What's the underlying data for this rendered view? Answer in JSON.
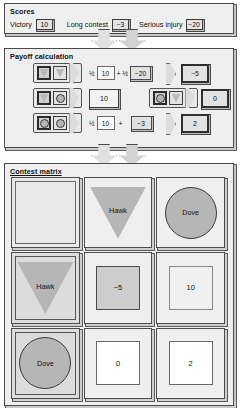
{
  "scores": {
    "title": "Scores",
    "items": [
      {
        "label": "Victory",
        "value": "10"
      },
      {
        "label": "Long contest",
        "value": "−3"
      },
      {
        "label": "Serious injury",
        "value": "−20"
      }
    ]
  },
  "payoff": {
    "title": "Payoff calculation",
    "rows": [
      {
        "focal": "hawk",
        "opponent": "hawk",
        "terms": [
          {
            "coef": "½",
            "value": "10",
            "style": "light"
          },
          {
            "op": "+",
            "coef": "½",
            "value": "−20",
            "style": "dark"
          }
        ],
        "result": "−5",
        "result_style": "bold"
      },
      {
        "focal": "hawk",
        "opponent": "dove",
        "terms": [
          {
            "coef": "",
            "value": "10",
            "style": "light"
          }
        ],
        "result": "10",
        "result_style": "bold"
      },
      {
        "focal": "dove",
        "opponent": "hawk",
        "terms": [],
        "result": "0",
        "result_style": "bold"
      },
      {
        "focal": "dove",
        "opponent": "dove",
        "terms": [
          {
            "coef": "½",
            "value": "10",
            "style": "light"
          },
          {
            "op": "+",
            "coef": "",
            "value": "−3",
            "style": "dark"
          }
        ],
        "result": "2",
        "result_style": "bold"
      }
    ]
  },
  "matrix": {
    "title": "Contest matrix",
    "corner": "",
    "col_headers": [
      "Hawk",
      "Dove"
    ],
    "row_headers": [
      "Hawk",
      "Dove"
    ],
    "values": [
      [
        "−5",
        "10"
      ],
      [
        "0",
        "2"
      ]
    ]
  },
  "icons": {
    "hawk": "triangle-icon",
    "dove": "circle-icon",
    "flow": "down-arrow-icon"
  },
  "colors": {
    "panel_bg": "#efefef",
    "shape_fill": "#b6b6b6",
    "border": "#4a4a4a"
  }
}
